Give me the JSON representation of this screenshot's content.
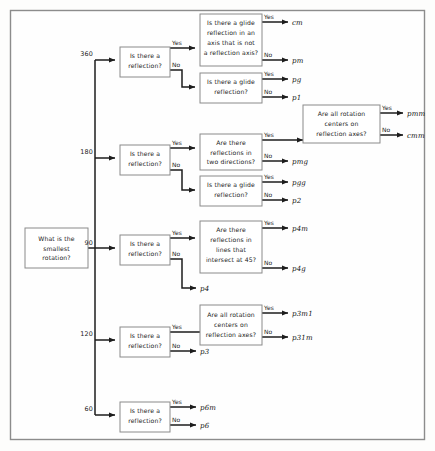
{
  "diagram": {
    "root": {
      "id": "root",
      "label_lines": [
        "What is the",
        "smallest",
        "rotation?"
      ]
    },
    "angle_labels": [
      {
        "id": "angle-360",
        "text": "360"
      },
      {
        "id": "angle-180",
        "text": "180"
      },
      {
        "id": "angle-90",
        "text": "90"
      },
      {
        "id": "angle-120",
        "text": "120"
      },
      {
        "id": "angle-60",
        "text": "60"
      }
    ],
    "edge_labels": {
      "yes": "Yes",
      "no": "No"
    },
    "decision_nodes": [
      {
        "id": "refl-360",
        "label_lines": [
          "Is there a",
          "reflection?"
        ]
      },
      {
        "id": "glide-not-refl-axis",
        "label_lines": [
          "Is there a glide",
          "reflection in an",
          "axis that is not",
          "a reflection axis?"
        ]
      },
      {
        "id": "glide-360",
        "label_lines": [
          "Is there a glide",
          "reflection?"
        ]
      },
      {
        "id": "refl-180",
        "label_lines": [
          "Is there a",
          "reflection?"
        ]
      },
      {
        "id": "two-directions",
        "label_lines": [
          "Are there",
          "reflections in",
          "two directions?"
        ]
      },
      {
        "id": "rot-centers-180",
        "label_lines": [
          "Are all rotation",
          "centers on",
          "reflection axes?"
        ]
      },
      {
        "id": "glide-180",
        "label_lines": [
          "Is there a glide",
          "reflection?"
        ]
      },
      {
        "id": "refl-90",
        "label_lines": [
          "Is there a",
          "reflection?"
        ]
      },
      {
        "id": "lines-45",
        "label_lines": [
          "Are there",
          "reflections in",
          "lines that",
          "intersect at 45?"
        ]
      },
      {
        "id": "refl-120",
        "label_lines": [
          "Is there a",
          "reflection?"
        ]
      },
      {
        "id": "rot-centers-120",
        "label_lines": [
          "Are all rotation",
          "centers on",
          "reflection axes?"
        ]
      },
      {
        "id": "refl-60",
        "label_lines": [
          "Is there a",
          "reflection?"
        ]
      }
    ],
    "results": [
      {
        "id": "result-cm",
        "text": "cm"
      },
      {
        "id": "result-pm",
        "text": "pm"
      },
      {
        "id": "result-pg",
        "text": "pg"
      },
      {
        "id": "result-p1",
        "text": "p1"
      },
      {
        "id": "result-pmm",
        "text": "pmm"
      },
      {
        "id": "result-cmm",
        "text": "cmm"
      },
      {
        "id": "result-pmg",
        "text": "pmg"
      },
      {
        "id": "result-pgg",
        "text": "pgg"
      },
      {
        "id": "result-p2",
        "text": "p2"
      },
      {
        "id": "result-p4m",
        "text": "p4m"
      },
      {
        "id": "result-p4g",
        "text": "p4g"
      },
      {
        "id": "result-p4",
        "text": "p4"
      },
      {
        "id": "result-p3m1",
        "text": "p3m1"
      },
      {
        "id": "result-p31m",
        "text": "p31m"
      },
      {
        "id": "result-p3",
        "text": "p3"
      },
      {
        "id": "result-p6m",
        "text": "p6m"
      },
      {
        "id": "result-p6",
        "text": "p6"
      }
    ],
    "colors": {
      "frame_border": "#8c8c8c",
      "node_border": "#8a8a8a",
      "edge": "#1c1c1c",
      "text": "#1a1a1a",
      "background": "#fdfdfc"
    }
  }
}
